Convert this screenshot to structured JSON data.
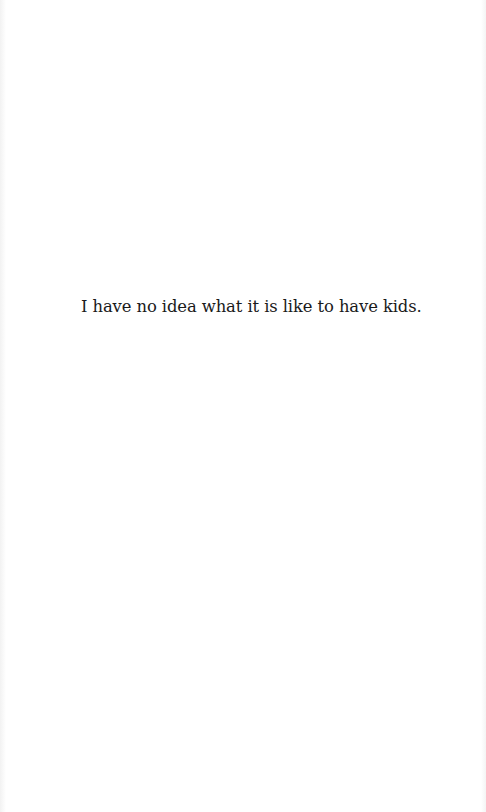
{
  "page": {
    "background": "#ffffff",
    "text_color": "#1a1a1a",
    "body_text": "I have no idea what it is like to have kids."
  }
}
